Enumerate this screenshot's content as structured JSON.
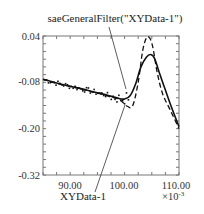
{
  "chart_data": {
    "type": "line",
    "title": "",
    "xlabel": "",
    "ylabel": "",
    "x_multiplier": "×10-3",
    "xlim": [
      85,
      110
    ],
    "ylim": [
      -0.32,
      0.04
    ],
    "x_ticks": [
      "90.00",
      "100.00",
      "110.00"
    ],
    "y_ticks": [
      "0.04",
      "-0.08",
      "-0.20",
      "-0.32"
    ],
    "grid": false,
    "legend": "none",
    "annotations": [
      {
        "text": "saeGeneralFilter(\"XYData-1\")",
        "points_to": "filtered solid curve near x=101.2"
      },
      {
        "text": "XYData-1",
        "points_to": "raw data near x=101"
      }
    ],
    "series": [
      {
        "name": "saeGeneralFilter(\"XYData-1\")",
        "style": "solid",
        "x": [
          85,
          87,
          89,
          91,
          93,
          95,
          97,
          99,
          100,
          101,
          102,
          103,
          104,
          104.8,
          105.5,
          106.5,
          107.5,
          108.5,
          110
        ],
        "y": [
          -0.072,
          -0.08,
          -0.087,
          -0.093,
          -0.1,
          -0.107,
          -0.114,
          -0.122,
          -0.123,
          -0.115,
          -0.085,
          -0.04,
          -0.015,
          -0.008,
          -0.018,
          -0.06,
          -0.1,
          -0.14,
          -0.195
        ]
      },
      {
        "name": "XYData-1 (dashed)",
        "style": "dashed",
        "x": [
          85,
          87,
          89,
          91,
          93,
          95,
          97,
          99,
          100.5,
          101.5,
          102.5,
          103.3,
          104,
          104.6,
          105.2,
          106,
          107,
          108.5,
          110
        ],
        "y": [
          -0.072,
          -0.081,
          -0.088,
          -0.094,
          -0.101,
          -0.108,
          -0.116,
          -0.124,
          -0.142,
          -0.14,
          -0.08,
          0.0,
          0.035,
          0.035,
          0.01,
          -0.055,
          -0.11,
          -0.155,
          -0.2
        ]
      }
    ]
  },
  "axes": {
    "x_tick_labels": [
      "90.00",
      "100.00",
      "110.00"
    ],
    "y_tick_labels": [
      "0.04",
      "-0.08",
      "-0.20",
      "-0.32"
    ],
    "x_multiplier_base": "×10",
    "x_multiplier_exp": "-3"
  },
  "annotations": {
    "top": "saeGeneralFilter(\"XYData-1\")",
    "bottom": "XYData-1"
  }
}
